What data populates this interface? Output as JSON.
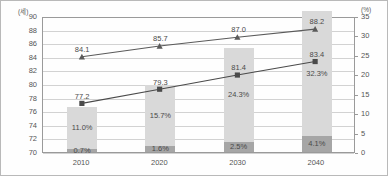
{
  "chart_data": {
    "type": "bar",
    "title": "",
    "subtitle": "",
    "xlabel": "",
    "ylabel": "",
    "categories": [
      "2010",
      "2020",
      "2030",
      "2040"
    ],
    "left_axis": {
      "unit": "(세)",
      "ylim": [
        70,
        90
      ],
      "ticks": [
        "90",
        "88",
        "86",
        "84",
        "82",
        "80",
        "78",
        "76",
        "74",
        "72",
        "70"
      ],
      "tick_values": [
        90,
        88,
        86,
        84,
        82,
        80,
        78,
        76,
        74,
        72,
        70
      ]
    },
    "right_axis": {
      "unit": "(%)",
      "ylim": [
        0,
        35
      ],
      "ticks": [
        "35",
        "30",
        "25",
        "20",
        "15",
        "10",
        "5",
        "0"
      ],
      "tick_values": [
        35,
        30,
        25,
        20,
        15,
        10,
        5,
        0
      ]
    },
    "grid": true,
    "legend_position": "none",
    "series": [
      {
        "name": "upper-line",
        "chart_type": "line",
        "marker": "triangle",
        "axis": "left",
        "values": [
          84.1,
          85.7,
          87.0,
          88.2
        ],
        "labels": [
          "84.1",
          "85.7",
          "87.0",
          "88.2"
        ],
        "color": "#5a5a5a"
      },
      {
        "name": "lower-line",
        "chart_type": "line",
        "marker": "square",
        "axis": "left",
        "values": [
          77.2,
          79.3,
          81.4,
          83.4
        ],
        "labels": [
          "77.2",
          "79.3",
          "81.4",
          "83.4"
        ],
        "color": "#4a4a4a"
      },
      {
        "name": "bar-upper-segment",
        "chart_type": "bar",
        "axis": "right",
        "stacked": true,
        "values": [
          11.0,
          15.7,
          24.3,
          32.3
        ],
        "labels": [
          "11.0%",
          "15.7%",
          "24.3%",
          "32.3%"
        ],
        "color": "#d9d9d9"
      },
      {
        "name": "bar-lower-segment",
        "chart_type": "bar",
        "axis": "right",
        "stacked": true,
        "values": [
          0.7,
          1.6,
          2.5,
          4.1
        ],
        "labels": [
          "0.7%",
          "1.6%",
          "2.5%",
          "4.1%"
        ],
        "color": "#a6a6a6"
      }
    ]
  }
}
